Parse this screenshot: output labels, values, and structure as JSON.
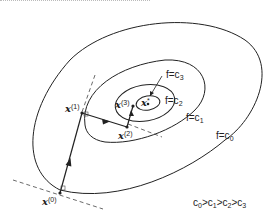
{
  "diagram": {
    "contours": [
      {
        "label_prefix": "f=c",
        "label_index": "0"
      },
      {
        "label_prefix": "f=c",
        "label_index": "1"
      },
      {
        "label_prefix": "f=c",
        "label_index": "2"
      },
      {
        "label_prefix": "f=c",
        "label_index": "3"
      }
    ],
    "points": [
      {
        "name": "x",
        "sup": "(0)"
      },
      {
        "name": "x",
        "sup": "(1)"
      },
      {
        "name": "x",
        "sup": "(2)"
      },
      {
        "name": "x",
        "sup": "(3)"
      },
      {
        "name": "x",
        "sup": "*"
      }
    ],
    "ordering": {
      "c": "c",
      "sep": ">",
      "indices": [
        "0",
        "1",
        "2",
        "3"
      ]
    }
  }
}
